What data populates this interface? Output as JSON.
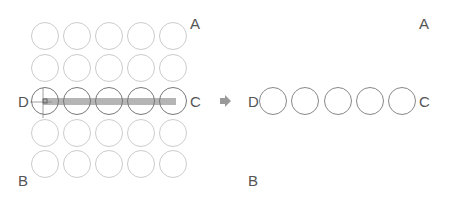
{
  "left_panel": {
    "labels": {
      "A": "A",
      "B": "B",
      "C": "C",
      "D": "D"
    },
    "grid": {
      "rows": 5,
      "cols": 5,
      "highlight_row": 3
    }
  },
  "right_panel": {
    "labels": {
      "A": "A",
      "B": "B",
      "C": "C",
      "D": "D"
    },
    "circle_count": 5
  },
  "colors": {
    "faint_circle": "#cccccc",
    "dark_circle": "#777777",
    "bar": "#b5b5b5",
    "arrow": "#999999",
    "text": "#555555"
  }
}
